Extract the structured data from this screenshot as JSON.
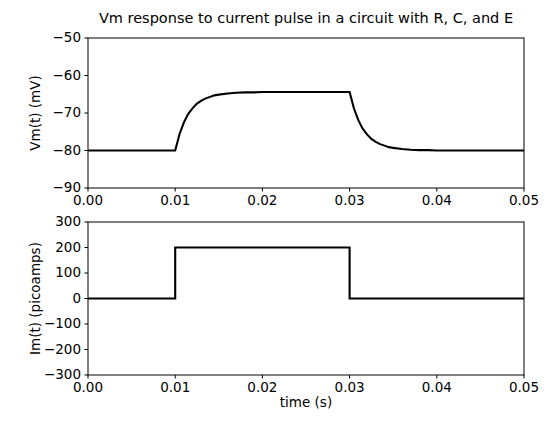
{
  "figure": {
    "title": "Vm response to current pulse in a circuit with R, C, and E",
    "width": 550,
    "height": 428,
    "background": "#ffffff",
    "line_color": "#000000",
    "axis_color": "#000000"
  },
  "chart_data": [
    {
      "type": "line",
      "id": "vm-plot",
      "title": "Vm response to current pulse in a circuit with R, C, and E",
      "xlabel": "",
      "ylabel": "Vm(t) (mV)",
      "xlim": [
        0.0,
        0.05
      ],
      "ylim": [
        -90,
        -50
      ],
      "xticks": [
        0.0,
        0.01,
        0.02,
        0.03,
        0.04,
        0.05
      ],
      "xticklabels": [
        "0.00",
        "0.01",
        "0.02",
        "0.03",
        "0.04",
        "0.05"
      ],
      "yticks": [
        -50,
        -60,
        -70,
        -80,
        -90
      ],
      "yticklabels": [
        "−50",
        "−60",
        "−70",
        "−80",
        "−90"
      ],
      "grid": false,
      "legend": null,
      "series": [
        {
          "name": "Vm(t)",
          "color": "#000000",
          "linewidth": 2.1,
          "resting_mV": -80.0,
          "plateau_mV": -64.4,
          "pulse_start_s": 0.01,
          "pulse_end_s": 0.03,
          "tau_s": 0.0015,
          "x": [
            0.0,
            0.001,
            0.002,
            0.003,
            0.004,
            0.005,
            0.006,
            0.007,
            0.008,
            0.009,
            0.01,
            0.0105,
            0.011,
            0.0115,
            0.012,
            0.0125,
            0.013,
            0.0135,
            0.014,
            0.0145,
            0.015,
            0.016,
            0.017,
            0.018,
            0.019,
            0.02,
            0.021,
            0.022,
            0.023,
            0.024,
            0.025,
            0.026,
            0.027,
            0.028,
            0.029,
            0.03,
            0.0305,
            0.031,
            0.0315,
            0.032,
            0.0325,
            0.033,
            0.0335,
            0.034,
            0.0345,
            0.035,
            0.036,
            0.037,
            0.038,
            0.039,
            0.04,
            0.042,
            0.044,
            0.046,
            0.048,
            0.05
          ],
          "y": [
            -80.0,
            -80.0,
            -80.0,
            -80.0,
            -80.0,
            -80.0,
            -80.0,
            -80.0,
            -80.0,
            -80.0,
            -80.0,
            -75.6,
            -72.5,
            -70.2,
            -68.7,
            -67.5,
            -66.7,
            -66.1,
            -65.7,
            -65.3,
            -65.1,
            -64.8,
            -64.6,
            -64.5,
            -64.5,
            -64.4,
            -64.4,
            -64.4,
            -64.4,
            -64.4,
            -64.4,
            -64.4,
            -64.4,
            -64.4,
            -64.4,
            -64.4,
            -68.8,
            -71.9,
            -74.2,
            -75.7,
            -76.9,
            -77.7,
            -78.3,
            -78.7,
            -79.1,
            -79.3,
            -79.6,
            -79.8,
            -79.9,
            -79.9,
            -80.0,
            -80.0,
            -80.0,
            -80.0,
            -80.0,
            -80.0
          ]
        }
      ]
    },
    {
      "type": "line",
      "id": "im-plot",
      "title": "",
      "xlabel": "time (s)",
      "ylabel": "Im(t) (picoamps)",
      "xlim": [
        0.0,
        0.05
      ],
      "ylim": [
        -300,
        300
      ],
      "xticks": [
        0.0,
        0.01,
        0.02,
        0.03,
        0.04,
        0.05
      ],
      "xticklabels": [
        "0.00",
        "0.01",
        "0.02",
        "0.03",
        "0.04",
        "0.05"
      ],
      "yticks": [
        300,
        200,
        100,
        0,
        -100,
        -200,
        -300
      ],
      "yticklabels": [
        "300",
        "200",
        "100",
        "0",
        "−100",
        "−200",
        "−300"
      ],
      "grid": false,
      "legend": null,
      "series": [
        {
          "name": "Im(t)",
          "color": "#000000",
          "linewidth": 2.1,
          "baseline_pA": 0,
          "amplitude_pA": 200,
          "pulse_start_s": 0.01,
          "pulse_end_s": 0.03,
          "x": [
            0.0,
            0.01,
            0.01,
            0.03,
            0.03,
            0.05
          ],
          "y": [
            0,
            0,
            200,
            200,
            0,
            0
          ]
        }
      ]
    }
  ]
}
